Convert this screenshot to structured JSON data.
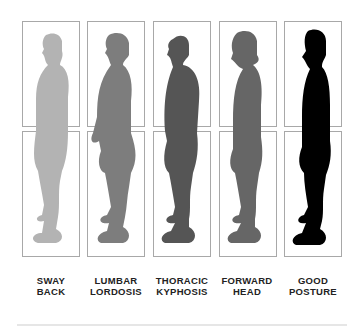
{
  "figures": [
    {
      "name": "sway-back",
      "line1": "SWAY",
      "line2": "BACK",
      "color": "#b3b3b3"
    },
    {
      "name": "lumbar-lordosis",
      "line1": "LUMBAR",
      "line2": "LORDOSIS",
      "color": "#7d7d7d"
    },
    {
      "name": "thoracic-kyphosis",
      "line1": "THORACIC",
      "line2": "KYPHOSIS",
      "color": "#555555"
    },
    {
      "name": "forward-head",
      "line1": "FORWARD",
      "line2": "HEAD",
      "color": "#666666"
    },
    {
      "name": "good-posture",
      "line1": "GOOD",
      "line2": "POSTURE",
      "color": "#000000"
    }
  ]
}
